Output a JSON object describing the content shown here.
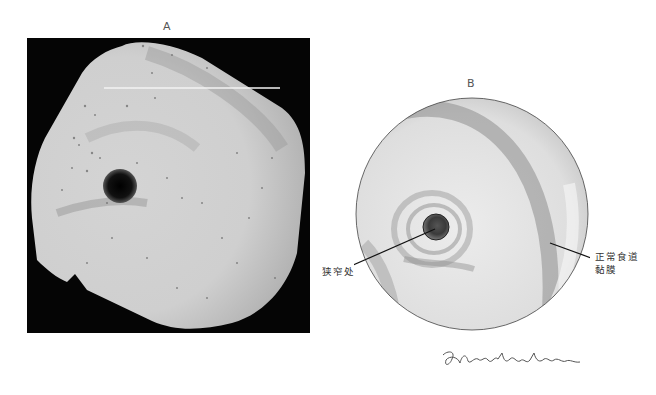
{
  "figure": {
    "panels": [
      {
        "id": "A",
        "label": "A",
        "type": "endoscopic-photograph",
        "description": "Grayscale endoscopic photograph showing a small dark lumen opening (stricture) surrounded by pale mucosa, on a black background"
      },
      {
        "id": "B",
        "label": "B",
        "type": "illustration",
        "description": "Circular pencil illustration of endoscopic view showing narrowed lumen and normal esophageal mucosa",
        "annotations": [
          {
            "id": "stricture",
            "text": "狭窄处"
          },
          {
            "id": "normal-mucosa",
            "line1": "正常食道",
            "line2": "黏膜"
          }
        ]
      }
    ],
    "signature": "G.Constantine"
  },
  "colors": {
    "background": "#ffffff",
    "photo_background": "#050505",
    "mucosa_light": "#d6d6d6",
    "lumen_dark": "#111111",
    "text": "#333333"
  }
}
